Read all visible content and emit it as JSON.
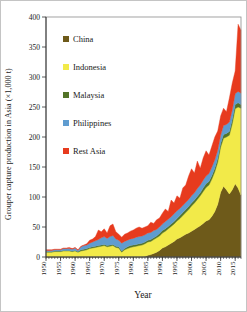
{
  "figure": {
    "y_axis_title": "Grouper capture production in Asia (×1,000 t)",
    "x_axis_title": "Year"
  },
  "legend": {
    "position": "top-left-inside-plot",
    "items": [
      {
        "label": "China",
        "color": "#6e5a1a"
      },
      {
        "label": "Indonesia",
        "color": "#f2ea49"
      },
      {
        "label": "Malaysia",
        "color": "#537427"
      },
      {
        "label": "Philippines",
        "color": "#5f9cd0"
      },
      {
        "label": "Rest Asia",
        "color": "#e73b1e"
      }
    ]
  },
  "chart_data": {
    "type": "area",
    "stacked": true,
    "title": "",
    "xlabel": "Year",
    "ylabel": "Grouper capture production in Asia (×1,000 t)",
    "ylim": [
      0,
      400
    ],
    "yticks": [
      0,
      50,
      100,
      150,
      200,
      250,
      300,
      350,
      400
    ],
    "xticks": [
      1950,
      1955,
      1960,
      1965,
      1970,
      1975,
      1980,
      1985,
      1990,
      1995,
      2000,
      2005,
      2010,
      2015
    ],
    "x_tick_label_rotation": -90,
    "grid": false,
    "legend_position": "top-left",
    "x": [
      1950,
      1951,
      1952,
      1953,
      1954,
      1955,
      1956,
      1957,
      1958,
      1959,
      1960,
      1961,
      1962,
      1963,
      1964,
      1965,
      1966,
      1967,
      1968,
      1969,
      1970,
      1971,
      1972,
      1973,
      1974,
      1975,
      1976,
      1977,
      1978,
      1979,
      1980,
      1981,
      1982,
      1983,
      1984,
      1985,
      1986,
      1987,
      1988,
      1989,
      1990,
      1991,
      1992,
      1993,
      1994,
      1995,
      1996,
      1997,
      1998,
      1999,
      2000,
      2001,
      2002,
      2003,
      2004,
      2005,
      2006,
      2007,
      2008,
      2009,
      2010,
      2011,
      2012,
      2013,
      2014,
      2015,
      2016,
      2017
    ],
    "series": [
      {
        "name": "China",
        "color": "#6e5a1a",
        "values": [
          0,
          0,
          0,
          0,
          0,
          0,
          0,
          0,
          0,
          0,
          0,
          0,
          0,
          0,
          0,
          0,
          0,
          0,
          0,
          0,
          0,
          0,
          0,
          0,
          0,
          0,
          0,
          0,
          0,
          0,
          0,
          0,
          0,
          0,
          1,
          3,
          4,
          6,
          8,
          11,
          15,
          17,
          20,
          23,
          26,
          30,
          32,
          35,
          38,
          40,
          43,
          46,
          49,
          52,
          56,
          60,
          62,
          68,
          76,
          88,
          108,
          118,
          112,
          105,
          112,
          122,
          115,
          103
        ]
      },
      {
        "name": "Indonesia",
        "color": "#f2ea49",
        "values": [
          8,
          8,
          8,
          9,
          9,
          9,
          10,
          10,
          10,
          9,
          10,
          8,
          10,
          11,
          12,
          14,
          15,
          16,
          17,
          18,
          19,
          17,
          18,
          19,
          16,
          15,
          8,
          12,
          14,
          16,
          17,
          18,
          19,
          20,
          21,
          22,
          22,
          23,
          24,
          24,
          25,
          26,
          27,
          28,
          29,
          30,
          32,
          34,
          36,
          39,
          42,
          44,
          47,
          50,
          53,
          56,
          58,
          62,
          66,
          70,
          75,
          80,
          88,
          98,
          110,
          125,
          135,
          145
        ]
      },
      {
        "name": "Malaysia",
        "color": "#537427",
        "values": [
          1,
          1,
          1,
          1,
          1,
          1,
          1,
          1,
          1,
          1,
          1,
          1,
          2,
          2,
          2,
          2,
          2,
          2,
          2,
          2,
          2,
          2,
          2,
          2,
          2,
          2,
          2,
          2,
          3,
          3,
          3,
          3,
          3,
          3,
          3,
          3,
          3,
          3,
          3,
          4,
          4,
          4,
          4,
          4,
          4,
          4,
          5,
          5,
          5,
          5,
          5,
          5,
          5,
          5,
          6,
          6,
          6,
          6,
          6,
          6,
          6,
          6,
          6,
          6,
          7,
          7,
          7,
          6
        ]
      },
      {
        "name": "Philippines",
        "color": "#5f9cd0",
        "values": [
          2,
          2,
          2,
          2,
          2,
          2,
          3,
          3,
          3,
          3,
          4,
          2,
          5,
          6,
          6,
          7,
          8,
          9,
          10,
          12,
          13,
          12,
          14,
          15,
          12,
          11,
          13,
          12,
          11,
          11,
          11,
          12,
          12,
          12,
          12,
          12,
          12,
          12,
          11,
          11,
          11,
          12,
          12,
          12,
          13,
          13,
          12,
          12,
          12,
          12,
          12,
          12,
          13,
          13,
          13,
          13,
          13,
          14,
          14,
          14,
          14,
          15,
          15,
          16,
          16,
          18,
          19,
          19
        ]
      },
      {
        "name": "Rest Asia",
        "color": "#e73b1e",
        "values": [
          1,
          1,
          1,
          1,
          1,
          1,
          1,
          1,
          2,
          1,
          1,
          1,
          1,
          1,
          2,
          5,
          5,
          7,
          16,
          10,
          13,
          9,
          18,
          19,
          12,
          10,
          10,
          12,
          12,
          13,
          14,
          15,
          16,
          13,
          13,
          12,
          17,
          12,
          16,
          15,
          18,
          21,
          13,
          28,
          18,
          25,
          17,
          29,
          29,
          39,
          45,
          33,
          46,
          28,
          37,
          42,
          31,
          35,
          38,
          32,
          32,
          29,
          21,
          40,
          45,
          38,
          112,
          105
        ]
      }
    ]
  }
}
